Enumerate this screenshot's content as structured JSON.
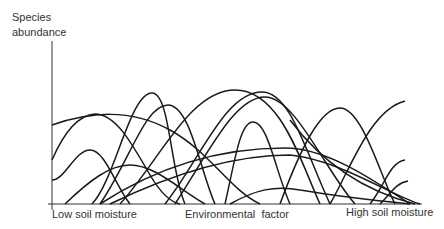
{
  "diagram": {
    "y_axis_label_line1": "Species",
    "y_axis_label_line2": "abundance",
    "x_axis_labels": {
      "left": "Low soil moisture",
      "center": "Environmental  factor",
      "right": "High soil moisture"
    },
    "curve_count": 16,
    "line_color": "#1a1a1a"
  }
}
